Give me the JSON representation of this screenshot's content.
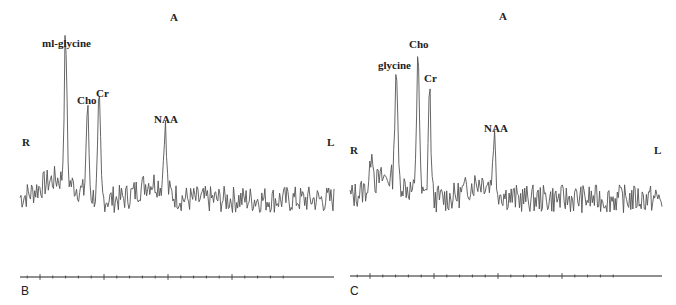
{
  "chart_data": [
    {
      "type": "line",
      "panel": "B",
      "title": "",
      "orientation_labels": {
        "top": "A",
        "left": "R",
        "right": "L"
      },
      "xlabel": "",
      "ylabel": "",
      "grid": false,
      "axis_ticks": {
        "major_count": 5,
        "minor_between": 4
      },
      "peaks": [
        {
          "label": "ml-glycine",
          "x_frac": 0.145,
          "rel_height": 1.0
        },
        {
          "label": "Cho",
          "x_frac": 0.215,
          "rel_height": 0.66
        },
        {
          "label": "Cr",
          "x_frac": 0.252,
          "rel_height": 0.71
        },
        {
          "label": "NAA",
          "x_frac": 0.462,
          "rel_height": 0.53
        }
      ],
      "baseline_rel": 0.15,
      "noise_rel": 0.08
    },
    {
      "type": "line",
      "panel": "C",
      "title": "",
      "orientation_labels": {
        "top": "A",
        "left": "R",
        "right": "L"
      },
      "xlabel": "",
      "ylabel": "",
      "grid": false,
      "axis_ticks": {
        "major_count": 5,
        "minor_between": 4
      },
      "peaks": [
        {
          "label": "glycine",
          "x_frac": 0.148,
          "rel_height": 0.81
        },
        {
          "label": "Cho",
          "x_frac": 0.218,
          "rel_height": 1.0
        },
        {
          "label": "Cr",
          "x_frac": 0.255,
          "rel_height": 0.77
        },
        {
          "label": "NAA",
          "x_frac": 0.462,
          "rel_height": 0.46
        },
        {
          "label": "",
          "x_frac": 0.07,
          "rel_height": 0.38
        }
      ],
      "baseline_rel": 0.15,
      "noise_rel": 0.08
    }
  ],
  "panels": {
    "b": {
      "letter": "B",
      "top_label": "A",
      "left_label": "R",
      "right_label": "L",
      "peak_labels": [
        "ml-glycine",
        "Cho",
        "Cr",
        "NAA"
      ]
    },
    "c": {
      "letter": "C",
      "top_label": "A",
      "left_label": "R",
      "right_label": "L",
      "peak_labels": [
        "glycine",
        "Cho",
        "Cr",
        "NAA"
      ]
    }
  },
  "colors": {
    "trace": "#555555",
    "axis": "#222222",
    "text": "#222222"
  }
}
